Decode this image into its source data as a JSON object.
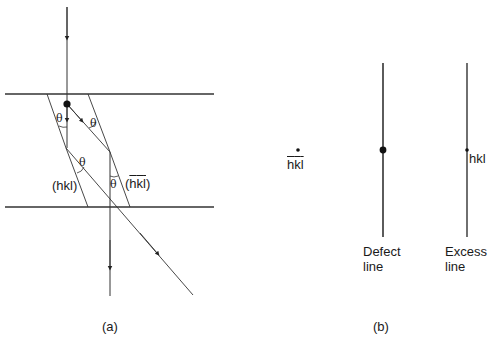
{
  "panel_a": {
    "caption": "(a)",
    "plane_label_left": "(hkl)",
    "plane_label_right_prefix": "(",
    "plane_label_right_h": "h",
    "plane_label_right_k": "k",
    "plane_label_right_l": "l",
    "plane_label_right_suffix": ")",
    "angle_symbol": "θ"
  },
  "panel_b": {
    "caption": "(b)",
    "spot_label_h": "h",
    "spot_label_k": "k",
    "spot_label_l": "l",
    "defect_label_line1": "Defect",
    "defect_label_line2": "line",
    "excess_label_line1": "Excess",
    "excess_label_line2": "line",
    "excess_spot_label": "hkl"
  },
  "colors": {
    "line": "#333333",
    "background": "#ffffff"
  }
}
